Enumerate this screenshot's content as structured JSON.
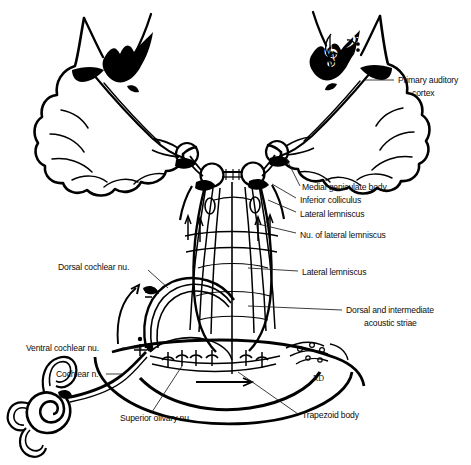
{
  "figure": {
    "background_color": "#ffffff",
    "ink_color": "#000000",
    "signature": "RD"
  },
  "labels": {
    "primary_auditory_cortex_line1": "Primary auditory",
    "primary_auditory_cortex_line2": "cortex",
    "medial_geniculate_body": "Medial geniculate body",
    "inferior_colliculus": "Inferior colliculus",
    "lateral_lemniscus_upper": "Lateral lemniscus",
    "nucleus_of_lateral_lemniscus": "Nu. of lateral lemniscus",
    "lateral_lemniscus_lower": "Lateral lemniscus",
    "dorsal_intermediate_striae_line1": "Dorsal and intermediate",
    "dorsal_intermediate_striae_line2": "acoustic striae",
    "dorsal_cochlear_nucleus": "Dorsal cochlear nu.",
    "ventral_cochlear_nucleus": "Ventral cochlear nu.",
    "cochlear_nerve": "Cochlear n.",
    "superior_olivary_nucleus": "Superior olivary nu.",
    "trapezoid_body": "Trapezoid body"
  },
  "icons": {
    "treble_clef": "𝄞",
    "bass_clef": "𝄢"
  }
}
